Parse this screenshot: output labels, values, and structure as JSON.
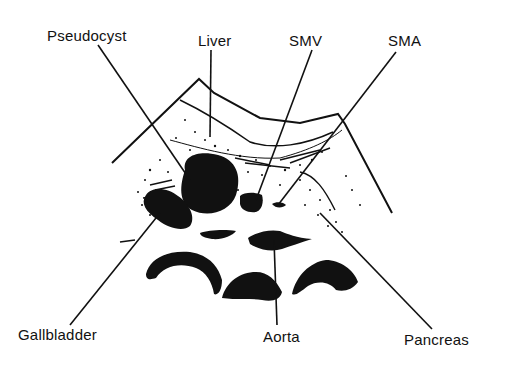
{
  "diagram": {
    "type": "ultrasound-transverse-section-line-drawing",
    "colors": {
      "ink": "#111111",
      "background": "#ffffff"
    },
    "labels": {
      "pseudocyst": "Pseudocyst",
      "liver": "Liver",
      "smv": "SMV",
      "sma": "SMA",
      "gallbladder": "Gallbladder",
      "aorta": "Aorta",
      "pancreas": "Pancreas"
    }
  }
}
